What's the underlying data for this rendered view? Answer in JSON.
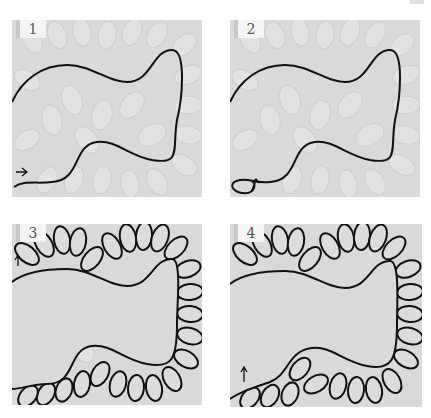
{
  "figure": {
    "type": "step-by-step quilting diagram (feather motif)",
    "panels": [
      {
        "step": "1",
        "description": "Background feather quilting with a wavy spine line drawn from bottom-left; arrow marks start"
      },
      {
        "step": "2",
        "description": "Spine line with small starting loop at bottom-left and arrow indicating direction"
      },
      {
        "step": "3",
        "description": "Feathers stitched along the outer side of the spine, first pass"
      },
      {
        "step": "4",
        "description": "Feathers completed on both sides; arrow at bottom-left starting point"
      }
    ]
  },
  "colors": {
    "panel_bg": "#d9d9d9",
    "line": "#111111",
    "badge_bg": "#f4f4f4",
    "badge_text": "#555555"
  }
}
